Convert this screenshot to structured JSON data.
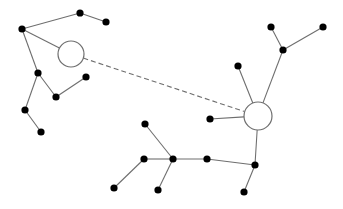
{
  "diagram": {
    "type": "tree-network",
    "colors": {
      "edge": "#6e6e6e",
      "node": "#000000",
      "hub_fill": "#ffffff",
      "background": "#ffffff"
    },
    "hubs": [
      {
        "id": "hubA",
        "x": 71,
        "y": 54,
        "r": 13
      },
      {
        "id": "hubB",
        "x": 258,
        "y": 116,
        "r": 14
      }
    ],
    "nodes": [
      {
        "id": "a1",
        "x": 22,
        "y": 29
      },
      {
        "id": "a2",
        "x": 80,
        "y": 13
      },
      {
        "id": "a3",
        "x": 106,
        "y": 22
      },
      {
        "id": "a4",
        "x": 38,
        "y": 73
      },
      {
        "id": "a5",
        "x": 56,
        "y": 97
      },
      {
        "id": "a6",
        "x": 86,
        "y": 77
      },
      {
        "id": "a7",
        "x": 25,
        "y": 110
      },
      {
        "id": "a8",
        "x": 41,
        "y": 132
      },
      {
        "id": "b1",
        "x": 271,
        "y": 27
      },
      {
        "id": "b2",
        "x": 323,
        "y": 27
      },
      {
        "id": "b3",
        "x": 283,
        "y": 50
      },
      {
        "id": "b4",
        "x": 238,
        "y": 66
      },
      {
        "id": "b5",
        "x": 210,
        "y": 119
      },
      {
        "id": "b6",
        "x": 255,
        "y": 165
      },
      {
        "id": "b7",
        "x": 244,
        "y": 192
      },
      {
        "id": "b8",
        "x": 207,
        "y": 159
      },
      {
        "id": "b9",
        "x": 173,
        "y": 159
      },
      {
        "id": "b10",
        "x": 145,
        "y": 124
      },
      {
        "id": "b11",
        "x": 144,
        "y": 159
      },
      {
        "id": "b12",
        "x": 114,
        "y": 188
      },
      {
        "id": "b13",
        "x": 158,
        "y": 190
      }
    ],
    "edges": [
      {
        "from": "a1",
        "to": "a2"
      },
      {
        "from": "a2",
        "to": "a3"
      },
      {
        "from": "a1",
        "to": "hubA"
      },
      {
        "from": "a1",
        "to": "a4"
      },
      {
        "from": "a4",
        "to": "a5"
      },
      {
        "from": "a5",
        "to": "a6"
      },
      {
        "from": "a4",
        "to": "a7"
      },
      {
        "from": "a7",
        "to": "a8"
      },
      {
        "from": "hubA",
        "to": "hubB",
        "style": "dashed"
      },
      {
        "from": "b1",
        "to": "b3"
      },
      {
        "from": "b2",
        "to": "b3"
      },
      {
        "from": "b3",
        "to": "hubB"
      },
      {
        "from": "b4",
        "to": "hubB"
      },
      {
        "from": "b5",
        "to": "hubB"
      },
      {
        "from": "hubB",
        "to": "b6"
      },
      {
        "from": "b6",
        "to": "b7"
      },
      {
        "from": "b6",
        "to": "b8"
      },
      {
        "from": "b8",
        "to": "b9"
      },
      {
        "from": "b9",
        "to": "b10"
      },
      {
        "from": "b9",
        "to": "b11"
      },
      {
        "from": "b9",
        "to": "b13"
      },
      {
        "from": "b11",
        "to": "b12"
      }
    ]
  }
}
